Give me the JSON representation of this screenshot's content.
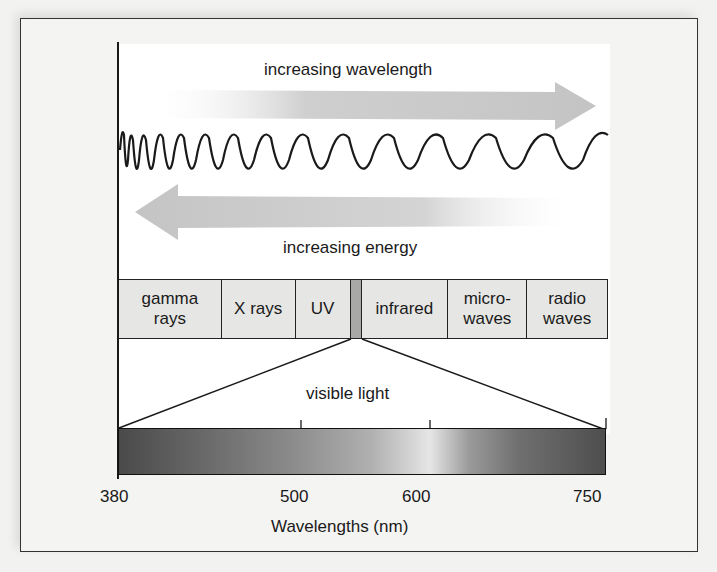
{
  "diagram": {
    "top_arrow_label": "increasing wavelength",
    "bottom_arrow_label": "increasing energy",
    "bands": [
      {
        "label": "gamma\nrays",
        "width": 103
      },
      {
        "label": "X rays",
        "width": 74
      },
      {
        "label": "UV",
        "width": 55
      },
      {
        "label": "",
        "width": 11,
        "is_visible": true
      },
      {
        "label": "infrared",
        "width": 87
      },
      {
        "label": "micro-\nwaves",
        "width": 79
      },
      {
        "label": "radio\nwaves",
        "width": 80
      }
    ],
    "visible_light_label": "visible light",
    "axis": {
      "ticks": [
        {
          "label": "380",
          "value": 380
        },
        {
          "label": "500",
          "value": 500
        },
        {
          "label": "600",
          "value": 600
        },
        {
          "label": "750",
          "value": 750
        }
      ],
      "title": "Wavelengths (nm)"
    },
    "colors": {
      "arrow_fill": "#c8c8c8",
      "line": "#1a1a1a",
      "band_fill": "#e6e6e4",
      "visible_band_fill": "#a8a8a6"
    }
  }
}
